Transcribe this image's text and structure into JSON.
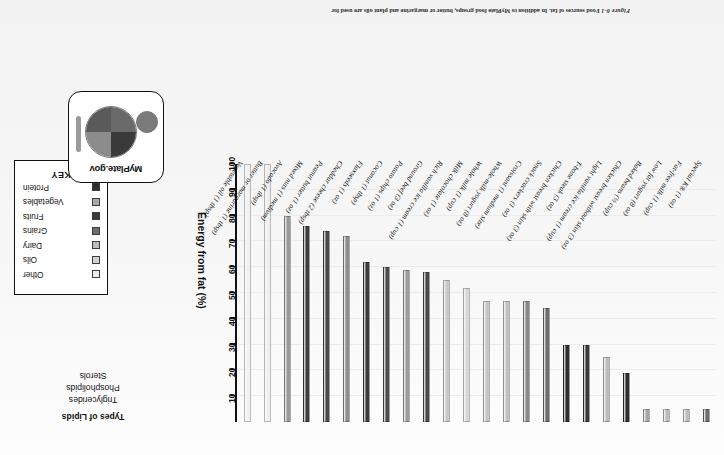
{
  "figure": {
    "number": "Figure 6-1",
    "caption": "Food sources of fat. In addition to MyPlate food groups, butter or margarine and plant oils are used for"
  },
  "lipids_panel": {
    "title": "Types of Lipids",
    "items": [
      "Triglycerides",
      "Phospholipids",
      "Sterols"
    ]
  },
  "key": {
    "title": "KEY",
    "items": [
      {
        "label": "Protein",
        "color": "#2f2f2f"
      },
      {
        "label": "Vegetables",
        "color": "#a8a8a8"
      },
      {
        "label": "Fruits",
        "color": "#3a3a3a"
      },
      {
        "label": "Grains",
        "color": "#6e6e6e"
      },
      {
        "label": "Dairy",
        "color": "#bdbdbd"
      },
      {
        "label": "Oils",
        "color": "#d2d2d2"
      },
      {
        "label": "Other",
        "color": "#ececec"
      }
    ]
  },
  "myplate": {
    "wordmark": "MyPlate",
    "domain": ".gov",
    "sections": [
      {
        "name": "fruits",
        "color": "#3a3a3a"
      },
      {
        "name": "grains",
        "color": "#8c8c8c"
      },
      {
        "name": "vegetables",
        "color": "#6a6a6a"
      },
      {
        "name": "protein",
        "color": "#5a5a5a"
      }
    ],
    "dairy_cup_color": "#7a7a7a",
    "utensil_color": "#9a9a9a"
  },
  "chart_data": {
    "type": "bar",
    "title": "Food sources of fat",
    "xlabel": "",
    "ylabel": "Energy from fat (%)",
    "ylim": [
      0,
      100
    ],
    "yticks": [
      10,
      20,
      30,
      40,
      50,
      60,
      70,
      80,
      90,
      100
    ],
    "grid": true,
    "orientation": "vertical",
    "legend_position": "right",
    "categories": [
      "Special K® (1 oz)",
      "Fat-free milk (1 cup)",
      "Low fat yogurt (8 oz)",
      "Baked beans (½ cup)",
      "Chicken breast without skin (3 oz)",
      "Light vanilla ice cream (1 cup)",
      "T-bone steak (3 oz)",
      "Chicken breast with skin (3 oz)",
      "Snack crackers (1 oz)",
      "Croissant (1 medium size)",
      "Whole-milk yogurt (8 oz)",
      "Whole milk (1 cup)",
      "Milk chocolate (1 oz)",
      "Rich vanilla ice cream (1 cup)",
      "Ground beef (3 oz)",
      "Potato chips (1 oz)",
      "Coconut (1 tbsp)",
      "Flaxseeds (1 oz)",
      "Cheddar cheese (2 tbsp)",
      "Peanut butter (1 oz)",
      "Mixed nuts (1 medium)",
      "Avocado (1 tbsp)",
      "Butter or margarine (1 tbsp)",
      "Vegetable oil (1 tbsp)"
    ],
    "values": [
      5,
      5,
      5,
      5,
      19,
      25,
      30,
      30,
      44,
      47,
      47,
      47,
      52,
      55,
      58,
      59,
      60,
      62,
      72,
      74,
      76,
      80,
      100,
      100
    ],
    "groups": [
      "Grains",
      "Dairy",
      "Dairy",
      "Vegetables",
      "Protein",
      "Dairy",
      "Protein",
      "Protein",
      "Grains",
      "Grains",
      "Dairy",
      "Dairy",
      "Other",
      "Dairy",
      "Protein",
      "Vegetables",
      "Fruits",
      "Protein",
      "Dairy",
      "Protein",
      "Protein",
      "Fruits",
      "Other",
      "Oils"
    ],
    "bar_colors": [
      "#6e6e6e",
      "#bdbdbd",
      "#bdbdbd",
      "#a8a8a8",
      "#2f2f2f",
      "#bdbdbd",
      "#3a3a3a",
      "#2f2f2f",
      "#6e6e6e",
      "#8a8a8a",
      "#c2c2c2",
      "#c6c6c6",
      "#d8d8d8",
      "#c9c9c9",
      "#4a4a4a",
      "#9e9e9e",
      "#4e4e4e",
      "#3c3c3c",
      "#8e8e8e",
      "#4a4a4a",
      "#3f3f3f",
      "#9a9a9a",
      "#efefef",
      "#f2f2f2"
    ]
  }
}
